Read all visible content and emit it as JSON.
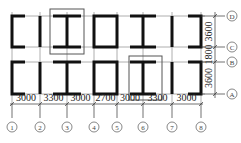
{
  "diagram": {
    "type": "structural-floor-plan",
    "vertical_axes": [
      {
        "label": "1",
        "x": 12
      },
      {
        "label": "2",
        "x": 40
      },
      {
        "label": "3",
        "x": 67
      },
      {
        "label": "4",
        "x": 94
      },
      {
        "label": "5",
        "x": 117
      },
      {
        "label": "6",
        "x": 143
      },
      {
        "label": "7",
        "x": 172
      },
      {
        "label": "8",
        "x": 201
      }
    ],
    "horizontal_axes": [
      {
        "label": "D",
        "y": 16
      },
      {
        "label": "C",
        "y": 47
      },
      {
        "label": "B",
        "y": 62
      },
      {
        "label": "A",
        "y": 94
      }
    ],
    "bottom_dimensions": [
      "3000",
      "3300",
      "3000",
      "2700",
      "3000",
      "3300",
      "3000"
    ],
    "right_dimensions": [
      "3600",
      "1800",
      "3600"
    ],
    "highlighted_regions": [
      {
        "name": "upper-highlight",
        "between_axes": [
          "2",
          "3"
        ],
        "rows": [
          "D",
          "C"
        ]
      },
      {
        "name": "lower-highlight",
        "between_axes": [
          "5",
          "6"
        ],
        "rows": [
          "B",
          "A"
        ]
      }
    ]
  }
}
